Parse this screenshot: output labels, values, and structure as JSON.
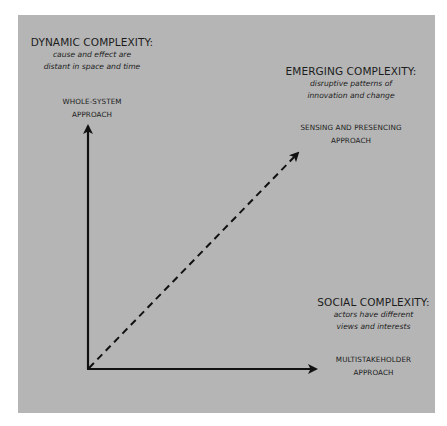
{
  "diagram": {
    "type": "three-axis complexity framework",
    "panel_color": "#b5b5b5",
    "line_color": "#111111",
    "axes": {
      "vertical": {
        "heading": "DYNAMIC COMPLEXITY:",
        "description_line1": "cause and effect are",
        "description_line2": "distant in space and time",
        "approach_line1": "WHOLE-SYSTEM",
        "approach_line2": "APPROACH",
        "style": "solid arrow"
      },
      "diagonal": {
        "heading": "EMERGING COMPLEXITY:",
        "description_line1": "disruptive patterns of",
        "description_line2": "innovation and change",
        "approach_line1": "SENSING AND PRESENCING",
        "approach_line2": "APPROACH",
        "style": "dashed arrow"
      },
      "horizontal": {
        "heading": "SOCIAL COMPLEXITY:",
        "description_line1": "actors have different",
        "description_line2": "views and interests",
        "approach_line1": "MULTISTAKEHOLDER",
        "approach_line2": "APPROACH",
        "style": "solid arrow"
      }
    }
  }
}
